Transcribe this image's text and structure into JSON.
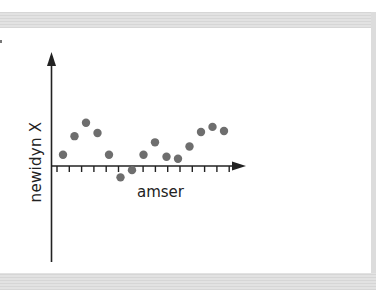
{
  "chart_data": {
    "type": "scatter",
    "title": "",
    "xlabel": "amser",
    "ylabel": "newidyn X",
    "grid": false,
    "legend": null,
    "x_tick_count": 15,
    "tick_labels": [],
    "x": [
      1,
      2,
      3,
      4,
      5,
      6,
      7,
      8,
      9,
      10,
      11,
      12,
      13,
      14,
      15
    ],
    "values": [
      1.0,
      2.8,
      4.1,
      3.1,
      1.0,
      -1.2,
      -0.5,
      1.0,
      2.2,
      0.8,
      0.6,
      1.8,
      3.2,
      3.7,
      3.3
    ],
    "point_color": "#6e6e6e",
    "axis_color": "#222222"
  },
  "labels": {
    "xlabel": "amser",
    "ylabel": "newidyn X"
  },
  "colors": {
    "band": "#dcdcdc",
    "panel": "#ffffff",
    "point": "#6e6e6e",
    "axis": "#222222"
  }
}
